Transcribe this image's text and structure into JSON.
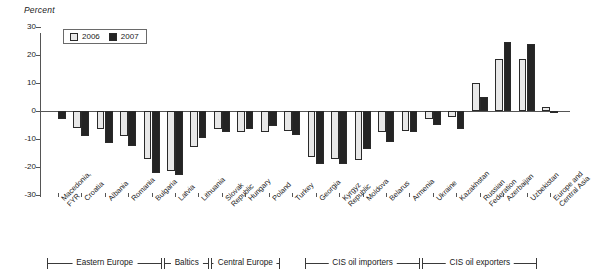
{
  "chart_data": {
    "type": "bar",
    "title": "",
    "subtitle": "",
    "ylabel": "Percent",
    "xlabel": "",
    "ylim": [
      -30,
      30
    ],
    "yticks": [
      30,
      20,
      10,
      0,
      -10,
      -20,
      -30
    ],
    "ytick_labels": [
      "30",
      "20",
      "10",
      "0",
      "-10",
      "-20",
      "-30"
    ],
    "grid": false,
    "legend_position": "top-left",
    "categories": [
      "Macedonia, FYR",
      "Croatia",
      "Albania",
      "Romania",
      "Bulgaria",
      "Latvia",
      "Lithuania",
      "Slovak Republic",
      "Hungary",
      "Poland",
      "Turkey",
      "Georgia",
      "Kyrgyz Republic",
      "Moldova",
      "Belarus",
      "Armenia",
      "Ukraine",
      "Kazakhstan",
      "Russian Federation",
      "Azerbaijan",
      "Uzbekistan",
      "Europe and Central Asia"
    ],
    "series": [
      {
        "name": "2006",
        "color": "#e8e8e8",
        "values": [
          null,
          -6.0,
          -6.5,
          -9.0,
          -17.0,
          -21.5,
          -13.0,
          -6.5,
          -7.5,
          -7.5,
          -7.0,
          -16.5,
          -17.0,
          -17.5,
          -7.5,
          -7.0,
          -3.0,
          -2.0,
          10.0,
          18.5,
          18.5,
          1.5
        ]
      },
      {
        "name": "2007",
        "color": "#242424",
        "values": [
          -3.0,
          -9.0,
          -11.5,
          -12.5,
          -22.0,
          -23.0,
          -9.5,
          -7.5,
          -6.5,
          -5.5,
          -8.5,
          -19.0,
          -19.0,
          -13.5,
          -11.0,
          -7.5,
          -5.0,
          -6.5,
          5.0,
          24.5,
          24.0,
          -0.5
        ]
      }
    ],
    "groups": [
      {
        "label": "Eastern Europe",
        "start": 0,
        "end": 4
      },
      {
        "label": "Baltics",
        "start": 5,
        "end": 6
      },
      {
        "label": "Central Europe",
        "start": 7,
        "end": 9
      },
      {
        "label": "CIS oil importers",
        "start": 11,
        "end": 15
      },
      {
        "label": "CIS oil exporters",
        "start": 16,
        "end": 20
      }
    ]
  },
  "legend": {
    "items": [
      {
        "label": "2006",
        "key": "s2006"
      },
      {
        "label": "2007",
        "key": "s2007"
      }
    ]
  }
}
